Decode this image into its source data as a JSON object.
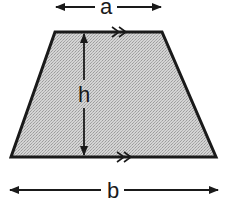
{
  "diagram": {
    "shape": "trapezoid",
    "fill_color": "#c8c8c8",
    "stroke_color": "#1a1a1a",
    "labels": {
      "top_base": "a",
      "bottom_base": "b",
      "height": "h"
    },
    "vertices": {
      "top_left": [
        55,
        32
      ],
      "top_right": [
        162,
        32
      ],
      "bottom_right": [
        216,
        157
      ],
      "bottom_left": [
        11,
        157
      ]
    },
    "parallel_marks": ">>",
    "dimension_arrows": [
      "a",
      "h",
      "b"
    ]
  }
}
